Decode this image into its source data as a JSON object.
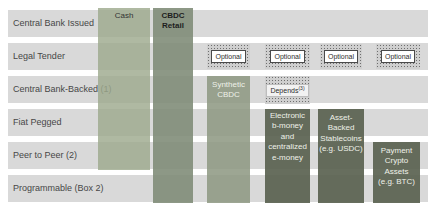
{
  "figure": {
    "rows": [
      {
        "label": "Central Bank Issued"
      },
      {
        "label": "Legal Tender"
      },
      {
        "label": "Central Bank-Backed (1)"
      },
      {
        "label": "Fiat Pegged"
      },
      {
        "label": "Peer to Peer (2)"
      },
      {
        "label": "Programmable (Box 2)"
      }
    ],
    "columns": [
      {
        "id": "cash",
        "label": "Cash",
        "covers_rows": "Central Bank Issued through Peer to Peer (2)"
      },
      {
        "id": "cbdc-retail",
        "label": "CBDC\nRetail",
        "covers_rows": "Central Bank Issued through Programmable (Box 2)"
      },
      {
        "id": "synthetic-cbdc",
        "label": "Synthetic\nCBDC",
        "legal_tender": "Optional",
        "covers_rows": "Central Bank-Backed (1) through Programmable (Box 2)"
      },
      {
        "id": "electronic-b-money",
        "label": "Electronic\nb-money\nand\ncentralized\ne-money",
        "legal_tender": "Optional",
        "central_bank_backed": "Depends (3)",
        "covers_rows": "Fiat Pegged through Programmable (Box 2)"
      },
      {
        "id": "asset-backed-stablecoins",
        "label": "Asset-\nBacked\nStablecoins\n(e.g. USDC)",
        "legal_tender": "Optional",
        "covers_rows": "Fiat Pegged through Programmable (Box 2)"
      },
      {
        "id": "payment-crypto-assets",
        "label": "Payment\nCrypto\nAssets\n(e.g. BTC)",
        "legal_tender": "Optional",
        "covers_rows": "Peer to Peer (2) through Programmable (Box 2)"
      }
    ],
    "badges": {
      "optional": "Optional",
      "depends": "Depends",
      "depends_footnote": "(3)"
    },
    "colors": {
      "row_band": "#d9d9d9",
      "cash_bar": "#b2bba7",
      "cbdc_retail_bar": "#93a08c",
      "synthetic_cbdc_bar": "#9da893",
      "dark_bar": "#6f7666",
      "bar_text_light": "#eef1e9",
      "row_label_text": "#474747"
    }
  }
}
